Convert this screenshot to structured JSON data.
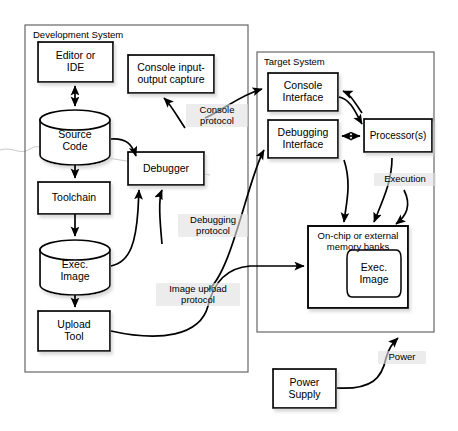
{
  "diagram": {
    "canvas": {
      "width": 458,
      "height": 431
    },
    "colors": {
      "background": "#ffffff",
      "stroke": "#000000",
      "container_stroke": "#555555",
      "shadow": "#bbbbbb",
      "label_backdrop": "#e1e1e1"
    }
  },
  "containers": [
    {
      "id": "development-system",
      "title": "Development System",
      "x": 25,
      "y": 25,
      "width": 223,
      "height": 347
    },
    {
      "id": "target-system",
      "title": "Target System",
      "x": 257,
      "y": 52,
      "width": 177,
      "height": 280
    }
  ],
  "nodes": {
    "editor_ide": {
      "label": "Editor or\nIDE",
      "shape": "rect",
      "x": 38,
      "y": 42,
      "width": 75,
      "height": 40
    },
    "source_code": {
      "label": "Source\nCode",
      "shape": "cylinder",
      "x": 40,
      "y": 110,
      "width": 70,
      "height": 55
    },
    "toolchain": {
      "label": "Toolchain",
      "shape": "rect",
      "x": 38,
      "y": 182,
      "width": 72,
      "height": 32
    },
    "exec_image_dev": {
      "label": "Exec.\nImage",
      "shape": "cylinder",
      "x": 40,
      "y": 240,
      "width": 70,
      "height": 55
    },
    "upload_tool": {
      "label": "Upload\nTool",
      "shape": "rect",
      "x": 38,
      "y": 311,
      "width": 72,
      "height": 40
    },
    "console_capture": {
      "label": "Console input-\noutput capture",
      "shape": "rect",
      "x": 128,
      "y": 55,
      "width": 86,
      "height": 38
    },
    "debugger": {
      "label": "Debugger",
      "shape": "rect",
      "x": 128,
      "y": 152,
      "width": 76,
      "height": 33
    },
    "console_interface": {
      "label": "Console\nInterface",
      "shape": "rect",
      "x": 268,
      "y": 73,
      "width": 70,
      "height": 38
    },
    "debugging_interface": {
      "label": "Debugging\nInterface",
      "shape": "rect",
      "x": 268,
      "y": 120,
      "width": 70,
      "height": 38
    },
    "processors": {
      "label": "Processor(s)",
      "shape": "rect",
      "x": 364,
      "y": 119,
      "width": 68,
      "height": 33
    },
    "memory_banks": {
      "label": "On-chip or external\nmemory banks",
      "shape": "rect",
      "x": 308,
      "y": 226,
      "width": 100,
      "height": 82
    },
    "exec_image_target": {
      "label": "Exec.\nImage",
      "shape": "rounded",
      "x": 347,
      "y": 250,
      "width": 54,
      "height": 47
    },
    "power_supply": {
      "label": "Power\nSupply",
      "shape": "rect",
      "x": 273,
      "y": 369,
      "width": 63,
      "height": 39
    }
  },
  "protocol_labels": [
    {
      "id": "console-protocol",
      "text": "Console\nprotocol",
      "x": 190,
      "y": 108
    },
    {
      "id": "debugging-protocol",
      "text": "Debugging\nprotocol",
      "x": 183,
      "y": 218
    },
    {
      "id": "image-upload-protocol",
      "text": "Image upload\nprotocol",
      "x": 165,
      "y": 288
    },
    {
      "id": "execution",
      "text": "Execution",
      "x": 378,
      "y": 177
    },
    {
      "id": "power",
      "text": "Power",
      "x": 383,
      "y": 355
    }
  ],
  "connections": [
    {
      "from": "editor_ide",
      "to": "source_code",
      "type": "double-arrow",
      "style": "straight"
    },
    {
      "from": "source_code",
      "to": "toolchain",
      "type": "arrow",
      "style": "straight"
    },
    {
      "from": "source_code",
      "to": "debugger",
      "type": "arrow",
      "style": "curved"
    },
    {
      "from": "toolchain",
      "to": "exec_image_dev",
      "type": "arrow",
      "style": "straight"
    },
    {
      "from": "exec_image_dev",
      "to": "debugger",
      "type": "arrow",
      "style": "curved"
    },
    {
      "from": "exec_image_dev",
      "to": "upload_tool",
      "type": "arrow",
      "style": "straight"
    },
    {
      "from": "console_interface",
      "to": "console_capture",
      "type": "arrow",
      "style": "curved",
      "label": "Console protocol"
    },
    {
      "from": "debugging_interface",
      "to": "debugger",
      "type": "arrow",
      "style": "curved",
      "label": "Debugging protocol"
    },
    {
      "from": "debugger",
      "to": "console_interface",
      "type": "arrow",
      "style": "curved"
    },
    {
      "from": "upload_tool",
      "to": "memory_banks",
      "type": "arrow",
      "style": "curved",
      "label": "Image upload protocol"
    },
    {
      "from": "console_interface",
      "to": "processors",
      "type": "arrow",
      "style": "curved"
    },
    {
      "from": "processors",
      "to": "console_interface",
      "type": "arrow",
      "style": "curved"
    },
    {
      "from": "debugging_interface",
      "to": "processors",
      "type": "double-arrow",
      "style": "straight"
    },
    {
      "from": "processors",
      "to": "memory_banks",
      "type": "arrow",
      "style": "curved",
      "label": "Execution"
    },
    {
      "from": "memory_banks",
      "to": "debugging_interface",
      "type": "arrow",
      "style": "curved"
    },
    {
      "from": "power_supply",
      "to": "target-system",
      "type": "arrow",
      "style": "curved",
      "label": "Power"
    }
  ]
}
